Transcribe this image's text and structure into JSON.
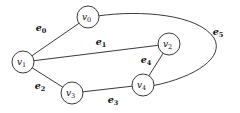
{
  "figure": {
    "background_color": "#ffffff",
    "stroke_color": "#3a3a3a",
    "text_color": "#111111",
    "width": 240,
    "height": 113
  },
  "chart_data": {
    "type": "diagram",
    "title": "",
    "nodes": [
      {
        "id": "v0",
        "label": "v",
        "subscript": "0",
        "x": 88,
        "y": 17,
        "r": 11
      },
      {
        "id": "v1",
        "label": "v",
        "subscript": "1",
        "x": 23,
        "y": 62,
        "r": 11
      },
      {
        "id": "v2",
        "label": "v",
        "subscript": "2",
        "x": 169,
        "y": 44,
        "r": 11
      },
      {
        "id": "v3",
        "label": "v",
        "subscript": "3",
        "x": 72,
        "y": 93,
        "r": 11
      },
      {
        "id": "v4",
        "label": "v",
        "subscript": "4",
        "x": 143,
        "y": 85,
        "r": 11
      }
    ],
    "edges": [
      {
        "id": "e0",
        "label": "e",
        "subscript": "0",
        "from": "v1",
        "to": "v0",
        "shape": "line",
        "label_x": 41,
        "label_y": 28
      },
      {
        "id": "e1",
        "label": "e",
        "subscript": "1",
        "from": "v1",
        "to": "v2",
        "shape": "line",
        "label_x": 101,
        "label_y": 42
      },
      {
        "id": "e2",
        "label": "e",
        "subscript": "2",
        "from": "v1",
        "to": "v3",
        "shape": "line",
        "label_x": 40,
        "label_y": 86
      },
      {
        "id": "e3",
        "label": "e",
        "subscript": "3",
        "from": "v3",
        "to": "v4",
        "shape": "line",
        "label_x": 113,
        "label_y": 100
      },
      {
        "id": "e4",
        "label": "e",
        "subscript": "4",
        "from": "v4",
        "to": "v2",
        "shape": "line",
        "label_x": 146,
        "label_y": 60
      },
      {
        "id": "e5",
        "label": "e",
        "subscript": "5",
        "from": "v0",
        "to": "v4",
        "shape": "curve",
        "label_x": 218,
        "label_y": 32
      }
    ]
  }
}
